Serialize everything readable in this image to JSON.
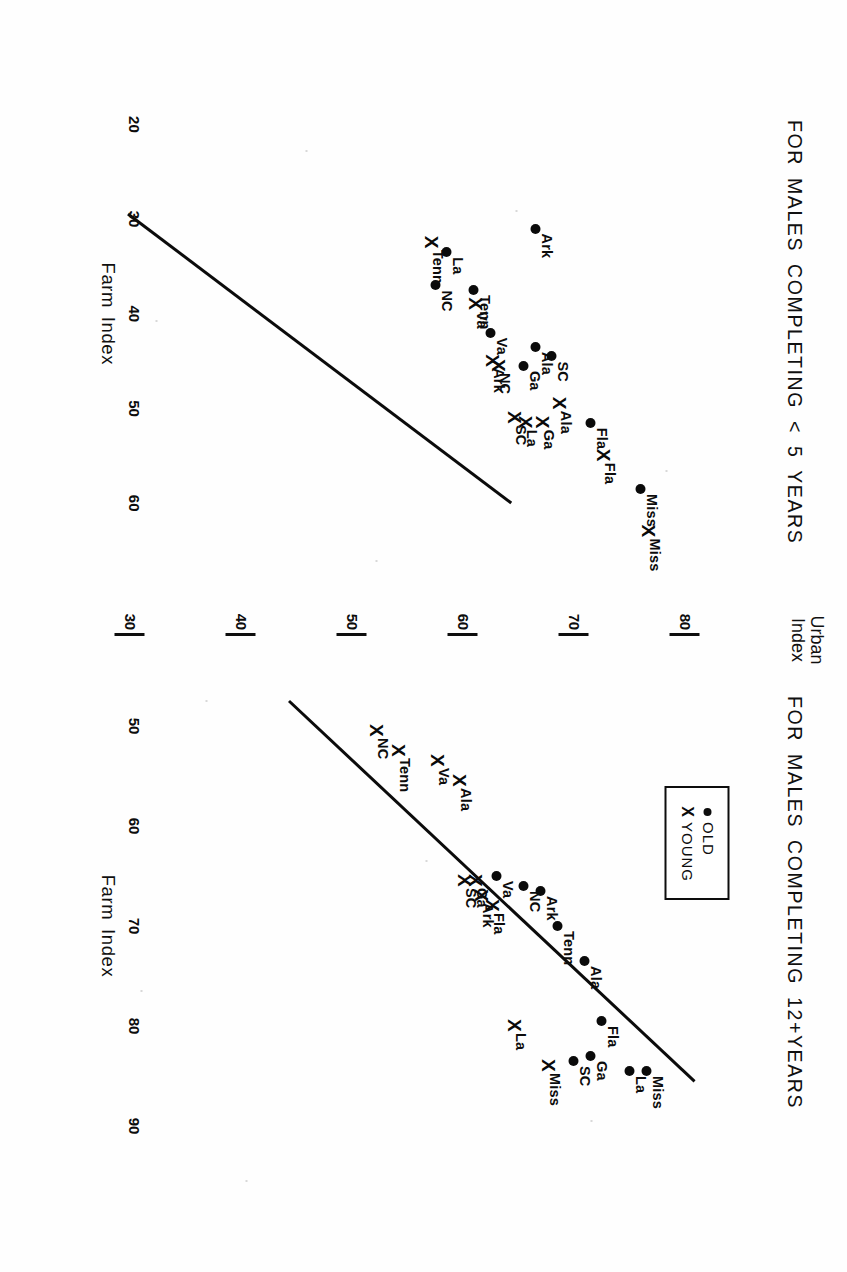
{
  "figure": {
    "background": "#ffffff",
    "ink": "#0c0c0c",
    "rotation": "90deg",
    "yaxis": {
      "title_line1": "Urban",
      "title_line2": "Index",
      "ticks": [
        "80",
        "70",
        "60",
        "50",
        "40",
        "30"
      ],
      "values": [
        80,
        70,
        60,
        50,
        40,
        30
      ]
    }
  },
  "legend": {
    "old_label": "OLD",
    "old_marker": "●",
    "young_label": "YOUNG",
    "young_marker": "X"
  },
  "panels": {
    "left": {
      "title": "FOR MALES COMPLETING < 5 YEARS",
      "xaxis_title": "Farm  Index",
      "xticks": [
        "20",
        "30",
        "40",
        "50",
        "60"
      ]
    },
    "right": {
      "title": "FOR MALES COMPLETING  12+YEARS",
      "xaxis_title": "Farm  Index",
      "xticks": [
        "50",
        "60",
        "70",
        "80",
        "90"
      ]
    }
  },
  "chart_data": [
    {
      "type": "scatter",
      "panel": "left",
      "title": "FOR MALES COMPLETING < 5 YEARS",
      "xlabel": "Farm  Index",
      "ylabel": "Urban Index",
      "xlim": [
        17,
        66
      ],
      "ylim": [
        27,
        86
      ],
      "xticks": [
        20,
        30,
        40,
        50,
        60
      ],
      "yticks": [
        30,
        40,
        50,
        60,
        70,
        80
      ],
      "grid": false,
      "legend": [
        "OLD",
        "YOUNG"
      ],
      "legend_position": "right-panel-upper-left",
      "series": [
        {
          "name": "OLD",
          "marker": "dot",
          "points": [
            {
              "label": "Miss",
              "x": 58.5,
              "y": 76.0
            },
            {
              "label": "Fla",
              "x": 51.5,
              "y": 71.5
            },
            {
              "label": "Ala",
              "x": 43.5,
              "y": 66.5
            },
            {
              "label": "SC",
              "x": 44.5,
              "y": 68.0
            },
            {
              "label": "Ga",
              "x": 45.5,
              "y": 65.5
            },
            {
              "label": "Va",
              "x": 42.0,
              "y": 62.5
            },
            {
              "label": "Ark",
              "x": 31.0,
              "y": 66.5
            },
            {
              "label": "Tenn",
              "x": 37.5,
              "y": 61.0
            },
            {
              "label": "La",
              "x": 33.5,
              "y": 58.5
            },
            {
              "label": "NC",
              "x": 37.0,
              "y": 57.5
            }
          ]
        },
        {
          "name": "YOUNG",
          "marker": "cross",
          "points": [
            {
              "label": "Miss",
              "x": 63.0,
              "y": 76.5
            },
            {
              "label": "Fla",
              "x": 55.0,
              "y": 72.5
            },
            {
              "label": "Ala",
              "x": 49.5,
              "y": 68.5
            },
            {
              "label": "Ga",
              "x": 51.5,
              "y": 67.0
            },
            {
              "label": "La",
              "x": 51.5,
              "y": 65.5
            },
            {
              "label": "SC",
              "x": 51.0,
              "y": 64.5
            },
            {
              "label": "NC",
              "x": 45.5,
              "y": 63.0
            },
            {
              "label": "Ark",
              "x": 45.0,
              "y": 62.5
            },
            {
              "label": "Va",
              "x": 39.0,
              "y": 61.0
            },
            {
              "label": "Tenn",
              "x": 32.5,
              "y": 57.0
            }
          ]
        }
      ],
      "fit_line": {
        "x1": 29.5,
        "y1": 30.0,
        "x2": 60.0,
        "y2": 64.5
      }
    },
    {
      "type": "scatter",
      "panel": "right",
      "title": "FOR MALES COMPLETING  12+YEARS",
      "xlabel": "Farm  Index",
      "ylabel": "Urban Index",
      "xlim": [
        45,
        93
      ],
      "ylim": [
        27,
        86
      ],
      "xticks": [
        50,
        60,
        70,
        80,
        90
      ],
      "yticks": [
        30,
        40,
        50,
        60,
        70,
        80
      ],
      "grid": false,
      "legend": [
        "OLD",
        "YOUNG"
      ],
      "series": [
        {
          "name": "OLD",
          "marker": "dot",
          "points": [
            {
              "label": "Miss",
              "x": 84.5,
              "y": 76.5
            },
            {
              "label": "La",
              "x": 84.5,
              "y": 75.0
            },
            {
              "label": "Ga",
              "x": 83.0,
              "y": 71.5
            },
            {
              "label": "SC",
              "x": 83.5,
              "y": 70.0
            },
            {
              "label": "Fla",
              "x": 79.5,
              "y": 72.5
            },
            {
              "label": "Ala",
              "x": 73.5,
              "y": 71.0
            },
            {
              "label": "Tenn",
              "x": 70.0,
              "y": 68.5
            },
            {
              "label": "Ark",
              "x": 66.5,
              "y": 67.0
            },
            {
              "label": "NC",
              "x": 66.0,
              "y": 65.5
            },
            {
              "label": "Va",
              "x": 65.0,
              "y": 63.0
            }
          ]
        },
        {
          "name": "YOUNG",
          "marker": "cross",
          "points": [
            {
              "label": "Miss",
              "x": 84.0,
              "y": 67.5
            },
            {
              "label": "La",
              "x": 80.0,
              "y": 64.5
            },
            {
              "label": "Fla",
              "x": 68.0,
              "y": 62.5
            },
            {
              "label": "Ark",
              "x": 67.0,
              "y": 61.5
            },
            {
              "label": "Ga",
              "x": 65.5,
              "y": 61.0
            },
            {
              "label": "SC",
              "x": 65.5,
              "y": 60.0
            },
            {
              "label": "Ala",
              "x": 55.5,
              "y": 59.5
            },
            {
              "label": "Va",
              "x": 53.5,
              "y": 57.5
            },
            {
              "label": "Tenn",
              "x": 52.5,
              "y": 54.0
            },
            {
              "label": "NC",
              "x": 50.5,
              "y": 52.0
            }
          ]
        }
      ],
      "fit_line": {
        "x1": 47.5,
        "y1": 44.5,
        "x2": 85.5,
        "y2": 81.0
      }
    }
  ]
}
